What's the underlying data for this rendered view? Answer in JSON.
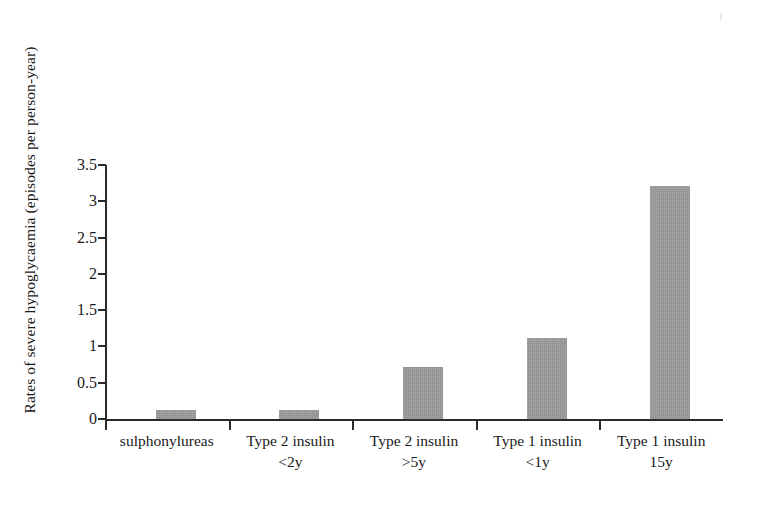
{
  "chart_data": {
    "type": "bar",
    "title": "",
    "subtitle": "",
    "xlabel": "",
    "ylabel": "Rates of severe hypoglycaemia (episodes per person-year)",
    "categories": [
      "sulphonylureas",
      "Type 2 insulin <2y",
      "Type 2 insulin >5y",
      "Type 1 insulin <1y",
      "Type 1 insulin 15y"
    ],
    "category_lines": [
      {
        "line1": "sulphonylureas",
        "line2": ""
      },
      {
        "line1": "Type 2 insulin",
        "line2": "<2y"
      },
      {
        "line1": "Type 2 insulin",
        "line2": ">5y"
      },
      {
        "line1": "Type 1 insulin",
        "line2": "<1y"
      },
      {
        "line1": "Type 1 insulin",
        "line2": "15y"
      }
    ],
    "values": [
      0.13,
      0.13,
      0.71,
      1.11,
      3.21
    ],
    "ylim": [
      0,
      3.5
    ],
    "ytick_labels": [
      "0",
      "0.5",
      "1",
      "1.5",
      "2",
      "2.5",
      "3",
      "3.5"
    ],
    "ytick_values": [
      0,
      0.5,
      1,
      1.5,
      2,
      2.5,
      3,
      3.5
    ],
    "grid": false,
    "legend": "none",
    "bar_color": "#9b9b9b",
    "axis_color": "#2b2b2b",
    "background_color": "#ffffff"
  }
}
